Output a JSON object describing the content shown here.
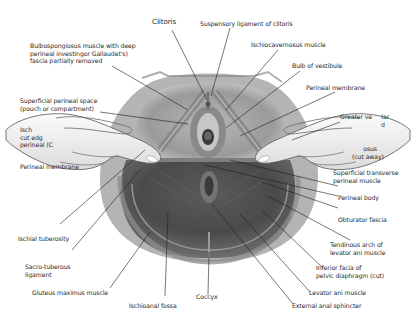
{
  "figure": {
    "colors": {
      "tissue_light": "#9c9c9c",
      "tissue_dark": "#4a4a4a",
      "skin": "#f2f2f2",
      "leader_line": "#1e1e1e",
      "text": "#2a2a2a"
    }
  },
  "labels": {
    "clitoris": "Clitoris",
    "suspensory_ligament": "Suspensory ligament of clitoris",
    "bulbospongiosus": "Bulbospongiosus muscle with deep\nperineal investingor Gallaudet's)\nfascia partially removed",
    "ischiocavernosus": "Ischiocavernosus muscle",
    "bulb_of_vestibule": "Bulb of vestibule",
    "perineal_membrane_right": "Perineal membrane",
    "superficial_perineal_space": "Superficial perineal space\n(pouch or compartment)",
    "ischio_cut_edge": "Isch\ncut edg\nperineal (C",
    "perineal_membrane_left": "Perineal membrane",
    "greater_vestibular": "Greater ve     lar\n                      d",
    "cut_away": "      osus\n(cut away)",
    "superficial_transverse": "Superficial transverse\nperineal muscle",
    "perineal_body": "Perineal body",
    "obturator_fascia": "Obturator fascia",
    "ischial_tuberosity": "Ischial tuberosity",
    "sacrotuberous": "Sacro-tuberous\nligament",
    "tendinous_arch": "Tendinous arch of\nlevator ani muscle",
    "inferior_fascia": "Inferior facia of\npelvic diaphragm (cut)",
    "gluteus_maximus": "Gluteus maximus muscle",
    "coccyx": "Coccyx",
    "levator_ani": "Levator ani muscle",
    "ischioanal_fossa": "Ischioanal fossa",
    "external_anal_sphincter": "External anal sphincter"
  }
}
